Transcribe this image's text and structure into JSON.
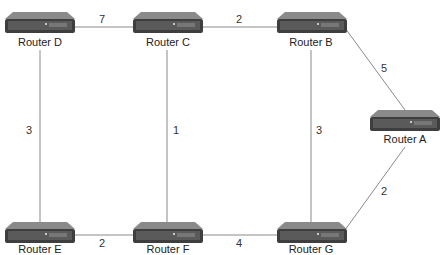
{
  "diagram": {
    "type": "network-topology",
    "nodes": [
      {
        "id": "D",
        "label": "Router D"
      },
      {
        "id": "C",
        "label": "Router C"
      },
      {
        "id": "B",
        "label": "Router B"
      },
      {
        "id": "A",
        "label": "Router A"
      },
      {
        "id": "E",
        "label": "Router E"
      },
      {
        "id": "F",
        "label": "Router F"
      },
      {
        "id": "G",
        "label": "Router G"
      }
    ],
    "edges": [
      {
        "from": "D",
        "to": "C",
        "weight": "7"
      },
      {
        "from": "C",
        "to": "B",
        "weight": "2"
      },
      {
        "from": "B",
        "to": "A",
        "weight": "5"
      },
      {
        "from": "D",
        "to": "E",
        "weight": "3"
      },
      {
        "from": "C",
        "to": "F",
        "weight": "1"
      },
      {
        "from": "B",
        "to": "G",
        "weight": "3"
      },
      {
        "from": "A",
        "to": "G",
        "weight": "2"
      },
      {
        "from": "E",
        "to": "F",
        "weight": "2"
      },
      {
        "from": "F",
        "to": "G",
        "weight": "4"
      }
    ],
    "icon": "router-icon",
    "colors": {
      "line": "#8a8a8a",
      "router_body": "#555555",
      "router_top": "#888888",
      "label": "#222222"
    }
  }
}
